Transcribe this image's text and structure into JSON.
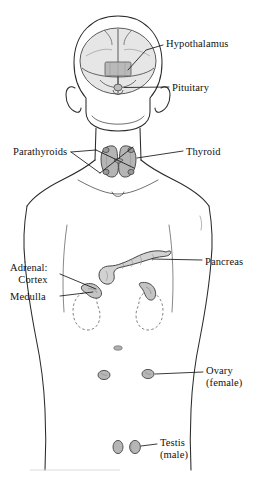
{
  "figure": {
    "background_color": "#ffffff",
    "outline_color": "#2b2b2b",
    "gland_fill": "#c9c9c9",
    "brain_fill": "#e2e2e2",
    "leader_line_color": "#1a1a1a"
  },
  "labels": {
    "hypothalamus": "Hypothalamus",
    "pituitary": "Pituitary",
    "thyroid": "Thyroid",
    "parathyroids": "Parathyroids",
    "pancreas": "Pancreas",
    "adrenal_heading": "Adrenal:",
    "adrenal_cortex": "Cortex",
    "adrenal_medulla": "Medulla",
    "ovary": "Ovary",
    "ovary_qualifier": "(female)",
    "testis": "Testis",
    "testis_qualifier": "(male)"
  },
  "structures": [
    {
      "name": "brain",
      "label": "Hypothalamus",
      "side": "right"
    },
    {
      "name": "pituitary-gland",
      "label": "Pituitary",
      "side": "right"
    },
    {
      "name": "thyroid-gland",
      "label": "Thyroid",
      "side": "right"
    },
    {
      "name": "parathyroid-glands",
      "label": "Parathyroids",
      "side": "left"
    },
    {
      "name": "pancreas",
      "label": "Pancreas",
      "side": "right"
    },
    {
      "name": "adrenal-cortex",
      "label": "Cortex",
      "side": "left"
    },
    {
      "name": "adrenal-medulla",
      "label": "Medulla",
      "side": "left"
    },
    {
      "name": "ovary",
      "label": "Ovary (female)",
      "side": "right"
    },
    {
      "name": "testis",
      "label": "Testis (male)",
      "side": "right"
    }
  ]
}
